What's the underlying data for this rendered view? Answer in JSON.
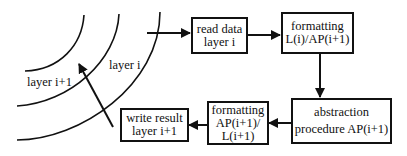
{
  "diagram": {
    "type": "flowchart",
    "boxes": [
      {
        "id": "read",
        "lines": [
          "read data",
          "layer i"
        ]
      },
      {
        "id": "fmt1",
        "lines": [
          "formatting",
          "L(i)/AP(i+1)"
        ]
      },
      {
        "id": "abs",
        "lines": [
          "abstraction",
          "procedure AP(i+1)"
        ]
      },
      {
        "id": "fmt2",
        "lines": [
          "formatting",
          "AP(i+1)/",
          "L(i+1)"
        ]
      },
      {
        "id": "write",
        "lines": [
          "write result",
          "layer i+1"
        ]
      }
    ],
    "layer_labels": {
      "inner": "layer i+1",
      "outer": "layer i"
    },
    "edges": [
      {
        "from": "layer i",
        "to": "read"
      },
      {
        "from": "read",
        "to": "fmt1"
      },
      {
        "from": "fmt1",
        "to": "abs"
      },
      {
        "from": "abs",
        "to": "fmt2"
      },
      {
        "from": "fmt2",
        "to": "write"
      },
      {
        "from": "write",
        "to": "layer i+1"
      }
    ]
  }
}
